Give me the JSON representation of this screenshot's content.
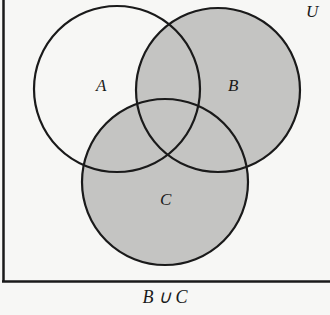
{
  "diagram": {
    "type": "venn",
    "universe_label": "U",
    "sets": [
      {
        "label": "A",
        "shaded": false
      },
      {
        "label": "B",
        "shaded": true
      },
      {
        "label": "C",
        "shaded": true
      }
    ],
    "caption": "B ∪ C",
    "colors": {
      "shade": "#c4c4c2",
      "stroke": "#1a1a1a",
      "background": "#f7f7f5"
    }
  }
}
